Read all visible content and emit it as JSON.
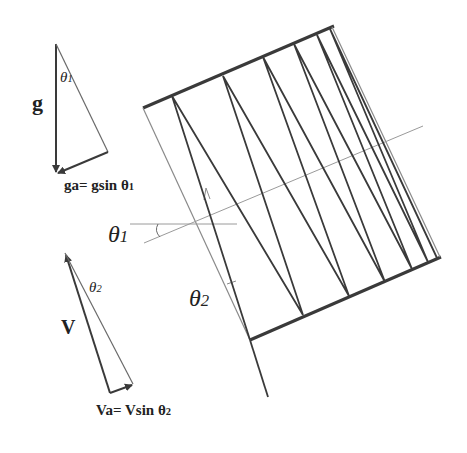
{
  "figure": {
    "colors": {
      "thick_line": "#3a3a3a",
      "thin_line": "#8a8a8a",
      "text": "#222222",
      "background": "#ffffff"
    }
  },
  "labels": {
    "g": "g",
    "theta1_small": "θ",
    "theta1_small_sub": "1",
    "ga_formula": "ga= gsin θ",
    "ga_formula_sub": "1",
    "theta1_big": "θ",
    "theta1_big_sub": "1",
    "theta2_big": "θ",
    "theta2_big_sub": "2",
    "theta2_small": "θ",
    "theta2_small_sub": "2",
    "V": "V",
    "Va_formula": "Va= Vsin θ",
    "Va_formula_sub": "2"
  },
  "geometry": {
    "slab_top_edge": [
      [
        143,
        108
      ],
      [
        334,
        26
      ]
    ],
    "slab_bottom_edge": [
      [
        250,
        340
      ],
      [
        441,
        257
      ]
    ],
    "slab_left_edge": [
      [
        143,
        108
      ],
      [
        250,
        340
      ]
    ],
    "incoming_ray": [
      [
        250,
        340
      ],
      [
        268,
        397
      ]
    ],
    "slab_axis": [
      [
        144,
        243
      ],
      [
        423,
        126
      ]
    ],
    "horizontal_ref": [
      [
        130,
        224
      ],
      [
        237,
        224
      ]
    ],
    "zigzag_ray": [
      [
        250,
        340
      ],
      [
        172,
        96
      ],
      [
        303,
        315
      ],
      [
        223,
        76
      ],
      [
        349,
        296
      ],
      [
        263,
        57
      ],
      [
        385,
        282
      ],
      [
        294,
        44
      ],
      [
        412,
        269
      ],
      [
        317,
        35
      ],
      [
        428,
        262
      ],
      [
        330,
        29
      ],
      [
        437,
        258
      ]
    ],
    "g_triangle": {
      "apex": [
        56,
        44
      ],
      "bottom": [
        56,
        173
      ],
      "right": [
        108,
        152
      ]
    },
    "v_triangle": {
      "apex": [
        65,
        253
      ],
      "bottom_left": [
        110,
        393
      ],
      "bottom_right": [
        133,
        384
      ]
    }
  }
}
